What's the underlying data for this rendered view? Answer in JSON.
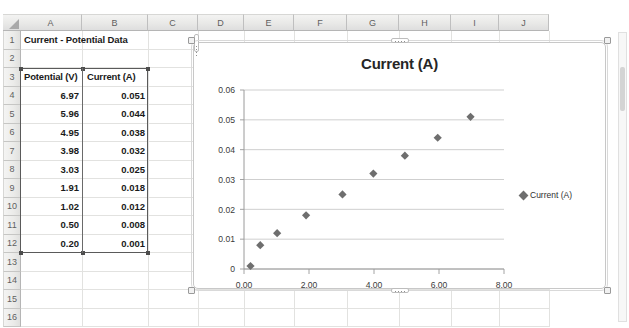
{
  "spreadsheet": {
    "corner_icon": "select-all-icon",
    "column_headers": [
      "A",
      "B",
      "C",
      "D",
      "E",
      "F",
      "G",
      "H",
      "I",
      "J"
    ],
    "row_headers": [
      "1",
      "2",
      "3",
      "4",
      "5",
      "6",
      "7",
      "8",
      "9",
      "10",
      "11",
      "12",
      "13",
      "14",
      "15",
      "16"
    ],
    "title_cell": "Current - Potential Data",
    "table_headers": [
      "Potential (V)",
      "Current (A)"
    ],
    "rows": [
      {
        "potential": "6.97",
        "current": "0.051"
      },
      {
        "potential": "5.96",
        "current": "0.044"
      },
      {
        "potential": "4.95",
        "current": "0.038"
      },
      {
        "potential": "3.98",
        "current": "0.032"
      },
      {
        "potential": "3.03",
        "current": "0.025"
      },
      {
        "potential": "1.91",
        "current": "0.018"
      },
      {
        "potential": "1.02",
        "current": "0.012"
      },
      {
        "potential": "0.50",
        "current": "0.008"
      },
      {
        "potential": "0.20",
        "current": "0.001"
      }
    ],
    "selected_range": "A3:B12"
  },
  "chart": {
    "title": "Current (A)",
    "legend_label": "Current (A)",
    "marker_color": "#6e6e6e",
    "gridline_color": "#c9c9c9",
    "axis_color": "#9a9a9a"
  },
  "chart_data": {
    "type": "scatter",
    "title": "Current (A)",
    "xlabel": "",
    "ylabel": "",
    "series": [
      {
        "name": "Current (A)",
        "x": [
          6.97,
          5.96,
          4.95,
          3.98,
          3.03,
          1.91,
          1.02,
          0.5,
          0.2
        ],
        "y": [
          0.051,
          0.044,
          0.038,
          0.032,
          0.025,
          0.018,
          0.012,
          0.008,
          0.001
        ],
        "marker": "diamond",
        "color": "#6e6e6e"
      }
    ],
    "xlim": [
      0,
      8
    ],
    "ylim": [
      0,
      0.06
    ],
    "xticks": [
      0,
      2,
      4,
      6,
      8
    ],
    "xtick_labels": [
      "0.00",
      "2.00",
      "4.00",
      "6.00",
      "8.00"
    ],
    "yticks": [
      0,
      0.01,
      0.02,
      0.03,
      0.04,
      0.05,
      0.06
    ],
    "ytick_labels": [
      "0",
      "0.01",
      "0.02",
      "0.03",
      "0.04",
      "0.05",
      "0.06"
    ],
    "grid": "horizontal",
    "legend_position": "right"
  }
}
